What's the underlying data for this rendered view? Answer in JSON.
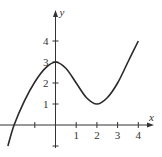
{
  "chart_data": {
    "type": "line",
    "title": "",
    "xlabel": "x",
    "ylabel": "y",
    "xlim": [
      -2.6,
      4.6
    ],
    "ylim": [
      -1.2,
      5.5
    ],
    "grid": false,
    "legend": null,
    "x_ticks": [
      -1,
      1,
      2,
      3,
      4
    ],
    "x_tick_labels": [
      "",
      "1",
      "2",
      "3",
      "4"
    ],
    "y_ticks": [
      -1,
      1,
      2,
      3,
      4
    ],
    "y_tick_labels": [
      "",
      "1",
      "2",
      "3",
      "4"
    ],
    "series": [
      {
        "name": "f(x)",
        "x": [
          -2.3,
          -2.0,
          -1.5,
          -1.0,
          -0.5,
          0.0,
          0.5,
          1.0,
          1.5,
          2.0,
          2.5,
          3.0,
          3.5,
          4.0
        ],
        "y": [
          -1.0,
          0.0,
          1.15,
          2.05,
          2.7,
          3.0,
          2.7,
          2.0,
          1.3,
          1.0,
          1.3,
          2.0,
          3.0,
          4.0
        ]
      }
    ],
    "annotations": [
      "local maximum at (0, 3)",
      "local minimum at (2, 1)"
    ]
  },
  "colors": {
    "curve": "#2a2a2a",
    "axis": "#333333",
    "background": "#ffffff"
  }
}
